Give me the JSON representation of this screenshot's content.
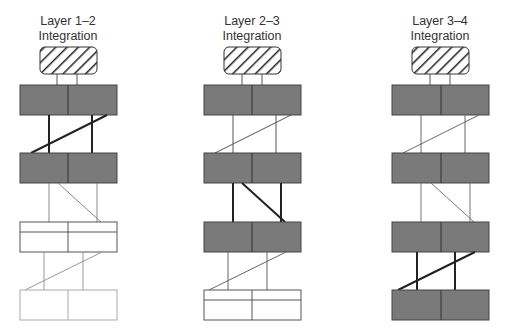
{
  "columns": [
    {
      "title_line1": "Layer 1–2",
      "title_line2": "Integration",
      "center_x": 68,
      "layers": [
        "filled",
        "filled",
        "split-white",
        "white-light"
      ],
      "links": [
        {
          "type": "straight",
          "weight": "bold",
          "cross": "up"
        },
        {
          "type": "light",
          "weight": "light",
          "cross": "down"
        },
        {
          "type": "light",
          "weight": "light",
          "cross": "up"
        }
      ]
    },
    {
      "title_line1": "Layer 2–3",
      "title_line2": "Integration",
      "center_x": 252,
      "layers": [
        "filled",
        "filled",
        "filled",
        "split-white"
      ],
      "links": [
        {
          "weight": "light",
          "cross": "up"
        },
        {
          "weight": "bold",
          "cross": "down"
        },
        {
          "weight": "light",
          "cross": "up"
        }
      ]
    },
    {
      "title_line1": "Layer 3–4",
      "title_line2": "Integration",
      "center_x": 440,
      "layers": [
        "filled",
        "filled",
        "filled",
        "filled"
      ],
      "links": [
        {
          "weight": "light",
          "cross": "up"
        },
        {
          "weight": "light",
          "cross": "down"
        },
        {
          "weight": "bold",
          "cross": "up"
        }
      ]
    }
  ],
  "colors": {
    "filled_box": "#7a7a7a",
    "outline": "#333333",
    "light_line": "#8a8a8a",
    "hatch": "#222222"
  }
}
